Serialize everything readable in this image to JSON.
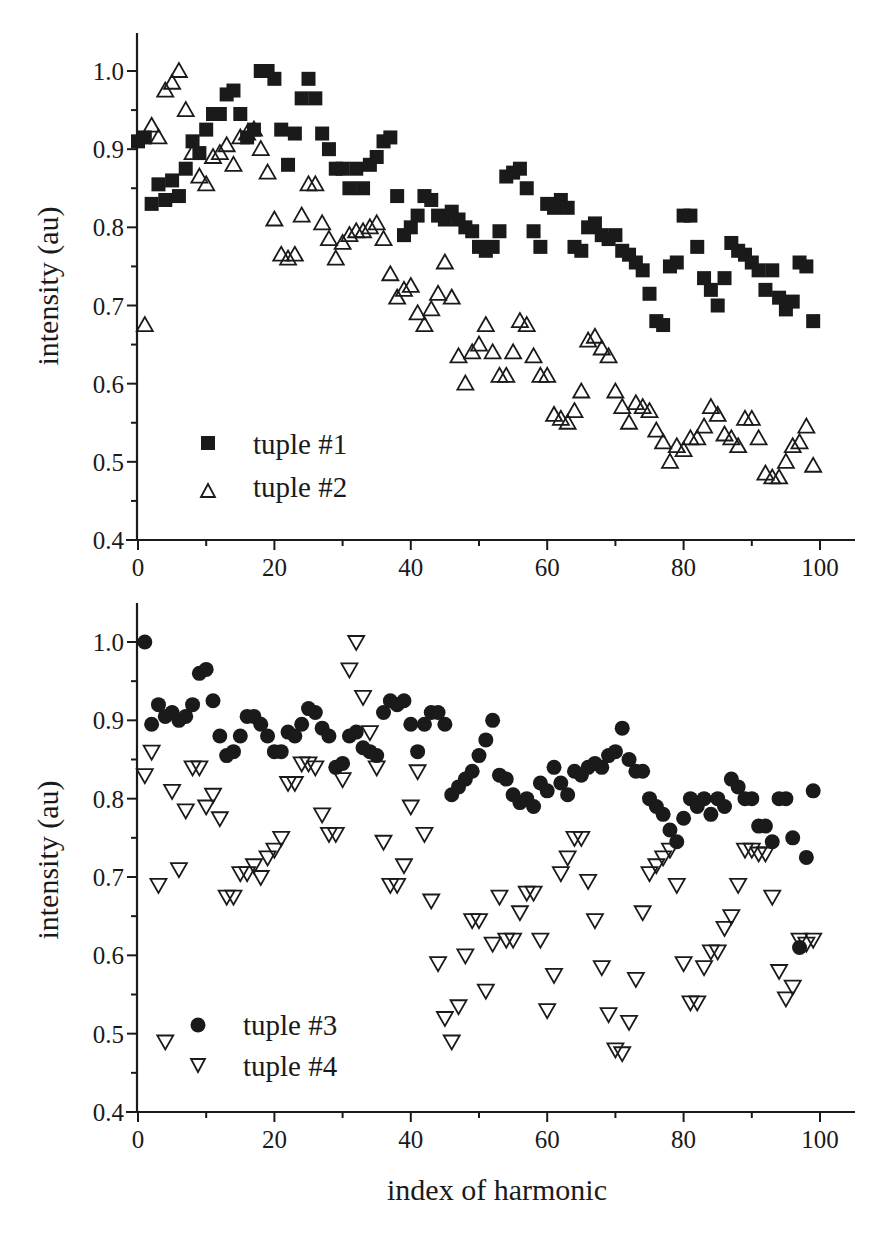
{
  "figure": {
    "xlabel": "index of harmonic",
    "background": "#ffffff",
    "ink": "#1a1a1a"
  },
  "chart_data": [
    {
      "type": "scatter",
      "panel": "top",
      "title": "",
      "xlabel": "",
      "ylabel": "intensity (au)",
      "xlim": [
        0,
        105
      ],
      "ylim": [
        0.4,
        1.05
      ],
      "xticks": [
        0,
        20,
        40,
        60,
        80,
        100
      ],
      "xtick_labels": [
        "0",
        "20",
        "40",
        "60",
        "80",
        "100"
      ],
      "yticks": [
        0.4,
        0.5,
        0.6,
        0.7,
        0.8,
        0.9,
        1.0
      ],
      "ytick_labels": [
        "0.4",
        "0.5",
        "0.6",
        "0.7",
        "0.8",
        "0.9",
        "1.0"
      ],
      "grid": false,
      "legend_position": "lower left",
      "series": [
        {
          "name": "tuple #1",
          "marker": "filled-square",
          "x": [
            0,
            1,
            2,
            3,
            4,
            5,
            6,
            7,
            8,
            9,
            10,
            11,
            12,
            13,
            14,
            15,
            16,
            17,
            18,
            19,
            20,
            21,
            22,
            23,
            24,
            25,
            26,
            27,
            28,
            29,
            30,
            31,
            32,
            33,
            34,
            35,
            36,
            37,
            38,
            39,
            40,
            41,
            42,
            43,
            44,
            45,
            46,
            47,
            48,
            49,
            50,
            51,
            52,
            53,
            54,
            55,
            56,
            57,
            58,
            59,
            60,
            61,
            62,
            63,
            64,
            65,
            66,
            67,
            68,
            69,
            70,
            71,
            72,
            73,
            74,
            75,
            76,
            77,
            78,
            79,
            80,
            81,
            82,
            83,
            84,
            85,
            86,
            87,
            88,
            89,
            90,
            91,
            92,
            93,
            94,
            95,
            96,
            97,
            98,
            99
          ],
          "values": [
            0.91,
            0.915,
            0.83,
            0.855,
            0.835,
            0.86,
            0.84,
            0.875,
            0.91,
            0.895,
            0.925,
            0.945,
            0.945,
            0.97,
            0.975,
            0.945,
            0.915,
            0.925,
            1.0,
            1.0,
            0.99,
            0.925,
            0.88,
            0.92,
            0.965,
            0.99,
            0.965,
            0.92,
            0.9,
            0.875,
            0.875,
            0.85,
            0.875,
            0.85,
            0.88,
            0.89,
            0.91,
            0.915,
            0.84,
            0.79,
            0.8,
            0.815,
            0.84,
            0.835,
            0.815,
            0.81,
            0.82,
            0.81,
            0.8,
            0.795,
            0.775,
            0.77,
            0.775,
            0.795,
            0.865,
            0.87,
            0.875,
            0.85,
            0.795,
            0.775,
            0.83,
            0.825,
            0.835,
            0.825,
            0.775,
            0.77,
            0.8,
            0.805,
            0.79,
            0.785,
            0.79,
            0.77,
            0.765,
            0.755,
            0.745,
            0.715,
            0.68,
            0.675,
            0.75,
            0.755,
            0.815,
            0.815,
            0.775,
            0.735,
            0.72,
            0.7,
            0.735,
            0.78,
            0.77,
            0.765,
            0.755,
            0.745,
            0.72,
            0.745,
            0.71,
            0.695,
            0.705,
            0.755,
            0.75,
            0.68
          ]
        },
        {
          "name": "tuple #2",
          "marker": "open-triangle-up",
          "x": [
            1,
            2,
            3,
            4,
            5,
            6,
            7,
            8,
            9,
            10,
            11,
            12,
            13,
            14,
            15,
            16,
            17,
            18,
            19,
            20,
            21,
            22,
            23,
            24,
            25,
            26,
            27,
            28,
            29,
            30,
            31,
            32,
            33,
            34,
            35,
            36,
            37,
            38,
            39,
            40,
            41,
            42,
            43,
            44,
            45,
            46,
            47,
            48,
            49,
            50,
            51,
            52,
            53,
            54,
            55,
            56,
            57,
            58,
            59,
            60,
            61,
            62,
            63,
            64,
            65,
            66,
            67,
            68,
            69,
            70,
            71,
            72,
            73,
            74,
            75,
            76,
            77,
            78,
            79,
            80,
            81,
            82,
            83,
            84,
            85,
            86,
            87,
            88,
            89,
            90,
            91,
            92,
            93,
            94,
            95,
            96,
            97,
            98,
            99
          ],
          "values": [
            0.675,
            0.93,
            0.915,
            0.975,
            0.985,
            1.0,
            0.95,
            0.895,
            0.865,
            0.855,
            0.89,
            0.895,
            0.905,
            0.88,
            0.915,
            0.92,
            0.925,
            0.9,
            0.87,
            0.81,
            0.765,
            0.76,
            0.765,
            0.815,
            0.855,
            0.855,
            0.805,
            0.785,
            0.76,
            0.78,
            0.79,
            0.795,
            0.795,
            0.8,
            0.805,
            0.785,
            0.74,
            0.71,
            0.72,
            0.725,
            0.69,
            0.675,
            0.695,
            0.715,
            0.755,
            0.71,
            0.635,
            0.6,
            0.64,
            0.65,
            0.675,
            0.64,
            0.61,
            0.61,
            0.64,
            0.68,
            0.675,
            0.635,
            0.61,
            0.61,
            0.56,
            0.555,
            0.55,
            0.565,
            0.59,
            0.655,
            0.66,
            0.645,
            0.635,
            0.59,
            0.57,
            0.55,
            0.575,
            0.57,
            0.565,
            0.54,
            0.525,
            0.5,
            0.52,
            0.515,
            0.53,
            0.53,
            0.545,
            0.57,
            0.56,
            0.535,
            0.53,
            0.52,
            0.555,
            0.555,
            0.53,
            0.485,
            0.48,
            0.48,
            0.5,
            0.52,
            0.525,
            0.545,
            0.495
          ]
        }
      ]
    },
    {
      "type": "scatter",
      "panel": "bottom",
      "title": "",
      "xlabel": "index of harmonic",
      "ylabel": "intensity (au)",
      "xlim": [
        0,
        105
      ],
      "ylim": [
        0.4,
        1.05
      ],
      "xticks": [
        0,
        20,
        40,
        60,
        80,
        100
      ],
      "xtick_labels": [
        "0",
        "20",
        "40",
        "60",
        "80",
        "100"
      ],
      "yticks": [
        0.4,
        0.5,
        0.6,
        0.7,
        0.8,
        0.9,
        1.0
      ],
      "ytick_labels": [
        "0.4",
        "0.5",
        "0.6",
        "0.7",
        "0.8",
        "0.9",
        "1.0"
      ],
      "grid": false,
      "legend_position": "lower left",
      "series": [
        {
          "name": "tuple #3",
          "marker": "filled-circle",
          "x": [
            1,
            2,
            3,
            4,
            5,
            6,
            7,
            8,
            9,
            10,
            11,
            12,
            13,
            14,
            15,
            16,
            17,
            18,
            19,
            20,
            21,
            22,
            23,
            24,
            25,
            26,
            27,
            28,
            29,
            30,
            31,
            32,
            33,
            34,
            35,
            36,
            37,
            38,
            39,
            40,
            41,
            42,
            43,
            44,
            45,
            46,
            47,
            48,
            49,
            50,
            51,
            52,
            53,
            54,
            55,
            56,
            57,
            58,
            59,
            60,
            61,
            62,
            63,
            64,
            65,
            66,
            67,
            68,
            69,
            70,
            71,
            72,
            73,
            74,
            75,
            76,
            77,
            78,
            79,
            80,
            81,
            82,
            83,
            84,
            85,
            86,
            87,
            88,
            89,
            90,
            91,
            92,
            93,
            94,
            95,
            96,
            97,
            98,
            99
          ],
          "values": [
            1.0,
            0.895,
            0.92,
            0.905,
            0.91,
            0.9,
            0.905,
            0.92,
            0.96,
            0.965,
            0.925,
            0.88,
            0.855,
            0.86,
            0.88,
            0.905,
            0.905,
            0.895,
            0.88,
            0.86,
            0.86,
            0.885,
            0.88,
            0.895,
            0.915,
            0.91,
            0.89,
            0.88,
            0.84,
            0.845,
            0.88,
            0.885,
            0.865,
            0.86,
            0.855,
            0.91,
            0.925,
            0.92,
            0.925,
            0.895,
            0.86,
            0.895,
            0.91,
            0.91,
            0.895,
            0.805,
            0.815,
            0.825,
            0.835,
            0.855,
            0.875,
            0.9,
            0.83,
            0.825,
            0.805,
            0.795,
            0.8,
            0.79,
            0.82,
            0.81,
            0.84,
            0.82,
            0.805,
            0.835,
            0.83,
            0.84,
            0.845,
            0.84,
            0.855,
            0.86,
            0.89,
            0.85,
            0.835,
            0.835,
            0.8,
            0.79,
            0.78,
            0.76,
            0.745,
            0.775,
            0.8,
            0.79,
            0.8,
            0.78,
            0.8,
            0.79,
            0.825,
            0.815,
            0.8,
            0.8,
            0.765,
            0.765,
            0.745,
            0.8,
            0.8,
            0.75,
            0.61,
            0.725,
            0.81
          ]
        },
        {
          "name": "tuple #4",
          "marker": "open-triangle-down",
          "x": [
            1,
            2,
            3,
            4,
            5,
            6,
            7,
            8,
            9,
            10,
            11,
            12,
            13,
            14,
            15,
            16,
            17,
            18,
            19,
            20,
            21,
            22,
            23,
            24,
            25,
            26,
            27,
            28,
            29,
            30,
            31,
            32,
            33,
            34,
            35,
            36,
            37,
            38,
            39,
            40,
            41,
            42,
            43,
            44,
            45,
            46,
            47,
            48,
            49,
            50,
            51,
            52,
            53,
            54,
            55,
            56,
            57,
            58,
            59,
            60,
            61,
            62,
            63,
            64,
            65,
            66,
            67,
            68,
            69,
            70,
            71,
            72,
            73,
            74,
            75,
            76,
            77,
            78,
            79,
            80,
            81,
            82,
            83,
            84,
            85,
            86,
            87,
            88,
            89,
            90,
            91,
            92,
            93,
            94,
            95,
            96,
            97,
            98,
            99
          ],
          "values": [
            0.83,
            0.86,
            0.69,
            0.49,
            0.81,
            0.71,
            0.785,
            0.84,
            0.84,
            0.79,
            0.805,
            0.775,
            0.675,
            0.675,
            0.705,
            0.705,
            0.715,
            0.7,
            0.725,
            0.735,
            0.75,
            0.82,
            0.82,
            0.845,
            0.845,
            0.84,
            0.78,
            0.755,
            0.755,
            0.825,
            0.965,
            1.0,
            0.93,
            0.885,
            0.84,
            0.745,
            0.69,
            0.69,
            0.715,
            0.79,
            0.835,
            0.755,
            0.67,
            0.59,
            0.52,
            0.49,
            0.535,
            0.6,
            0.645,
            0.645,
            0.555,
            0.615,
            0.675,
            0.62,
            0.62,
            0.655,
            0.68,
            0.68,
            0.62,
            0.53,
            0.575,
            0.705,
            0.725,
            0.75,
            0.75,
            0.695,
            0.645,
            0.585,
            0.525,
            0.48,
            0.475,
            0.515,
            0.57,
            0.655,
            0.705,
            0.715,
            0.725,
            0.735,
            0.69,
            0.59,
            0.54,
            0.54,
            0.585,
            0.605,
            0.605,
            0.635,
            0.65,
            0.69,
            0.735,
            0.735,
            0.73,
            0.73,
            0.675,
            0.58,
            0.545,
            0.56,
            0.62,
            0.615,
            0.62
          ]
        }
      ]
    }
  ],
  "legends": {
    "top": [
      "tuple #1",
      "tuple #2"
    ],
    "bottom": [
      "tuple #3",
      "tuple #4"
    ]
  }
}
